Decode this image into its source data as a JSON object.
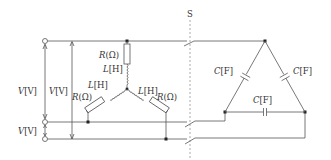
{
  "diagram": {
    "type": "circuit",
    "switch": {
      "label": "S"
    },
    "voltage_labels": {
      "line_top": "V[V]",
      "line_inner": "V[V]",
      "line_bottom": "V[V]"
    },
    "star_load": {
      "top_leg": {
        "resistor": "R[Ω]",
        "inductor": "L[H]"
      },
      "left_leg": {
        "resistor": "R[Ω]",
        "inductor": "L[H]"
      },
      "right_leg": {
        "resistor": "R[Ω]",
        "inductor": "L[H]"
      }
    },
    "delta_load": {
      "left_cap": "C[F]",
      "right_cap": "C[F]",
      "bottom_cap": "C[F]"
    }
  }
}
